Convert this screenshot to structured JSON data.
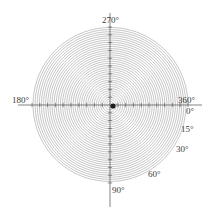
{
  "figure": {
    "title": "",
    "background_color": "#ffffff",
    "width": 218,
    "height": 216
  },
  "chart_data": {
    "type": "line",
    "plot_kind": "polar-spiral",
    "title": "",
    "subtitle": "",
    "xlabel": "",
    "ylabel": "",
    "grid": false,
    "legend": null,
    "coordinate_system": "polar",
    "angle_unit": "degrees",
    "angle_direction": "clockwise",
    "angle_zero_location": "east",
    "axis_line_color": "#4d4d4d",
    "spiral_color": "#808080",
    "center_marker_color": "#1a1a1a",
    "radial_max": 1.0,
    "theta_range_degrees": [
      0,
      13320
    ],
    "turns": 37,
    "spiral_equation": "r = theta / theta_max",
    "angle_tick_labels": [
      {
        "label": "270°",
        "angle_degrees": 270,
        "position": "top"
      },
      {
        "label": "360°",
        "angle_degrees": 360,
        "position": "right-upper"
      },
      {
        "label": "0°",
        "angle_degrees": 0,
        "position": "right-lower"
      },
      {
        "label": "15°",
        "angle_degrees": 15,
        "position": "right-lower-15"
      },
      {
        "label": "30°",
        "angle_degrees": 30,
        "position": "right-lower-30"
      },
      {
        "label": "60°",
        "angle_degrees": 60,
        "position": "bottom-right-60"
      },
      {
        "label": "90°",
        "angle_degrees": 90,
        "position": "bottom"
      },
      {
        "label": "180°",
        "angle_degrees": 180,
        "position": "left"
      }
    ],
    "axes": [
      {
        "name": "horizontal-axis",
        "from_degrees": 180,
        "to_degrees": 0
      },
      {
        "name": "vertical-axis",
        "from_degrees": 270,
        "to_degrees": 90
      }
    ],
    "radial_ticks": [
      0.1,
      0.2,
      0.3,
      0.4,
      0.5,
      0.6,
      0.7,
      0.8,
      0.9,
      1.0
    ]
  },
  "labels": {
    "deg_270": "270°",
    "deg_360": "360°",
    "deg_0": "0°",
    "deg_15": "15°",
    "deg_30": "30°",
    "deg_60": "60°",
    "deg_90": "90°",
    "deg_180": "180°"
  }
}
